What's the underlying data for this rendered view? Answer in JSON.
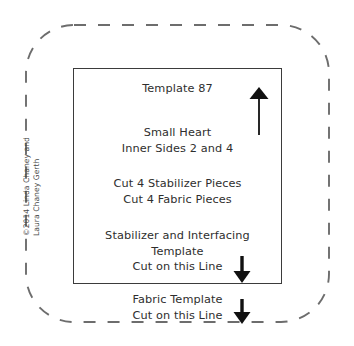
{
  "document": {
    "kind": "sewing-pattern-template",
    "background_color": "#ffffff"
  },
  "fabric_boundary": {
    "label": "fabric-cut-boundary",
    "style": "dashed",
    "color": "#6d6d6d",
    "corner_radius": 48
  },
  "template_rect": {
    "label": "stabilizer-cut-boundary",
    "style": "solid",
    "color": "#3b3b3b"
  },
  "title": {
    "text": "Template 87"
  },
  "piece_name": {
    "line1": "Small Heart",
    "line2": "Inner Sides 2 and 4"
  },
  "cut_instructions": {
    "line1": "Cut 4 Stabilizer Pieces",
    "line2": "Cut 4 Fabric Pieces"
  },
  "stabilizer_instructions": {
    "line1": "Stabilizer and Interfacing",
    "line2": "Template",
    "line3": "Cut on this Line"
  },
  "fabric_instructions": {
    "line1": "Fabric Template",
    "line2": "Cut on this Line"
  },
  "arrows": {
    "grain": "arrow-up-icon",
    "stabilizer_cut": "arrow-down-icon",
    "fabric_cut": "arrow-down-icon",
    "color": "#111111"
  },
  "copyright": {
    "line1": "©2014 Linda Chaney and",
    "line2": "Laura Chaney Gerth"
  }
}
